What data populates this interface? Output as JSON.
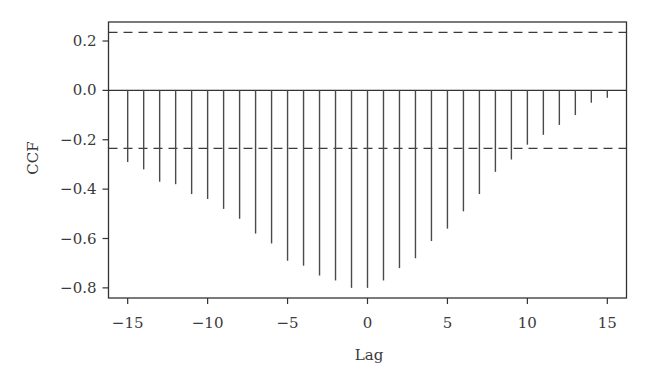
{
  "chart_data": {
    "type": "bar",
    "subtype": "cross-correlation stem plot",
    "title": "",
    "xlabel": "Lag",
    "ylabel": "CCF",
    "xlim": [
      -16.2,
      16.2
    ],
    "ylim": [
      -0.841,
      0.277
    ],
    "grid": false,
    "legend": null,
    "x_ticks": [
      -15,
      -10,
      -5,
      0,
      5,
      10,
      15
    ],
    "x_tick_labels": [
      "−15",
      "−10",
      "−5",
      "0",
      "5",
      "10",
      "15"
    ],
    "y_ticks": [
      0.2,
      0.0,
      -0.2,
      -0.4,
      -0.6,
      -0.8
    ],
    "y_tick_labels": [
      "0.2",
      "0.0",
      "−0.2",
      "−0.4",
      "−0.6",
      "−0.8"
    ],
    "x": [
      -15,
      -14,
      -13,
      -12,
      -11,
      -10,
      -9,
      -8,
      -7,
      -6,
      -5,
      -4,
      -3,
      -2,
      -1,
      0,
      1,
      2,
      3,
      4,
      5,
      6,
      7,
      8,
      9,
      10,
      11,
      12,
      13,
      14,
      15
    ],
    "values": [
      -0.29,
      -0.32,
      -0.37,
      -0.38,
      -0.42,
      -0.44,
      -0.48,
      -0.52,
      -0.58,
      -0.62,
      -0.69,
      -0.71,
      -0.75,
      -0.77,
      -0.8,
      -0.8,
      -0.77,
      -0.72,
      -0.68,
      -0.61,
      -0.56,
      -0.49,
      -0.42,
      -0.33,
      -0.28,
      -0.22,
      -0.18,
      -0.14,
      -0.1,
      -0.05,
      -0.03
    ],
    "confidence_bounds": {
      "upper": 0.235,
      "lower": -0.235,
      "style": "dashed"
    },
    "zero_line": 0.0
  },
  "style": {
    "bar_color": "#4a4a4a",
    "axis_color": "#333333",
    "dash_color": "#3a3a3a",
    "background": "#ffffff"
  },
  "layout": {
    "plot_left": 108.5,
    "plot_right": 626.5,
    "plot_top": 22,
    "plot_bottom": 298
  }
}
